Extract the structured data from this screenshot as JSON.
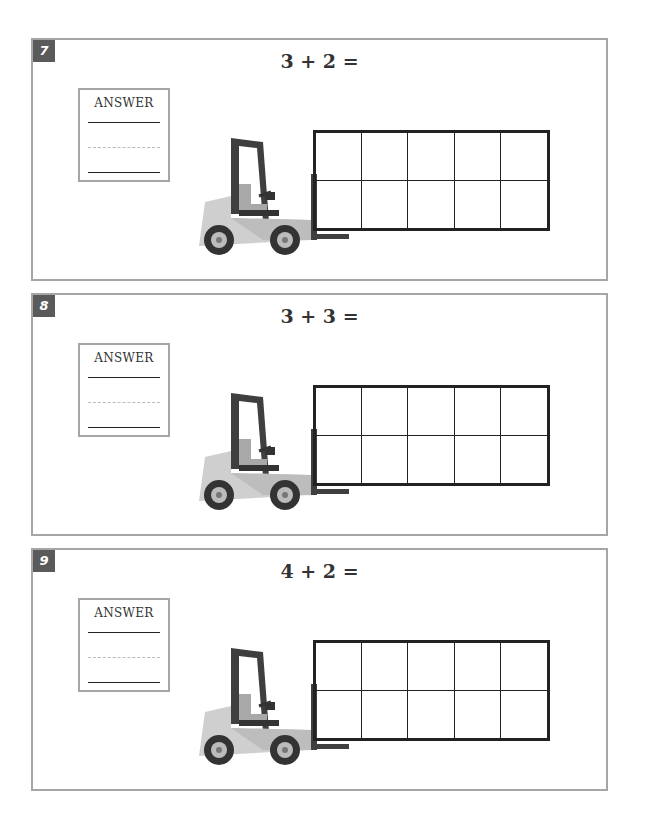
{
  "problems": [
    {
      "number": "7",
      "equation": "3 + 2 =",
      "answer_label": "ANSWER"
    },
    {
      "number": "8",
      "equation": "3 + 3 =",
      "answer_label": "ANSWER"
    },
    {
      "number": "9",
      "equation": "4 + 2 =",
      "answer_label": "ANSWER"
    }
  ],
  "ten_frame": {
    "rows": 2,
    "columns": 5
  },
  "colors": {
    "panel_border": "#a6a6a6",
    "badge": "#5a5a5a",
    "forklift_body": "#d0d0d0",
    "forklift_dark": "#3f3f3f"
  }
}
